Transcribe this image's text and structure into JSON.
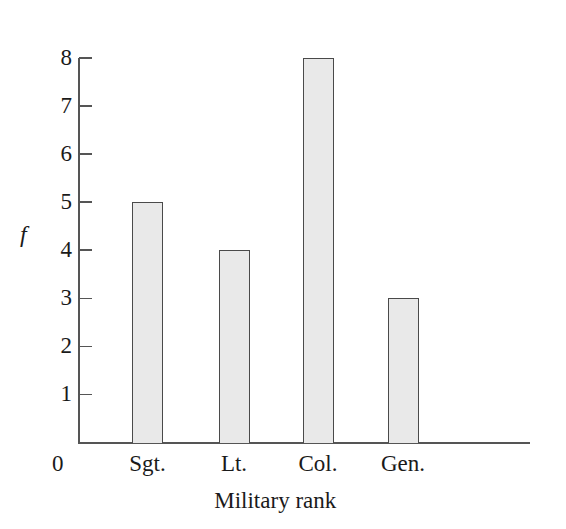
{
  "chart_data": {
    "type": "bar",
    "title": "",
    "subtitle": "",
    "categories": [
      "Sgt.",
      "Lt.",
      "Col.",
      "Gen."
    ],
    "values": [
      5,
      4,
      8,
      3
    ],
    "xlabel": "Military rank",
    "ylabel": "f",
    "ylim": [
      0,
      8
    ],
    "ytick_labels": [
      "8",
      "7",
      "6",
      "5",
      "4",
      "3",
      "2",
      "1"
    ],
    "ytick_values": [
      8,
      7,
      6,
      5,
      4,
      3,
      2,
      1
    ],
    "origin_label": "0",
    "grid": false,
    "legend": null,
    "annotations": [],
    "colors": {
      "bar_fill": "#e9e9e9",
      "bar_border": "#4a4a4a",
      "axis": "#555555",
      "text": "#1a1a1a",
      "background": "#ffffff"
    }
  }
}
